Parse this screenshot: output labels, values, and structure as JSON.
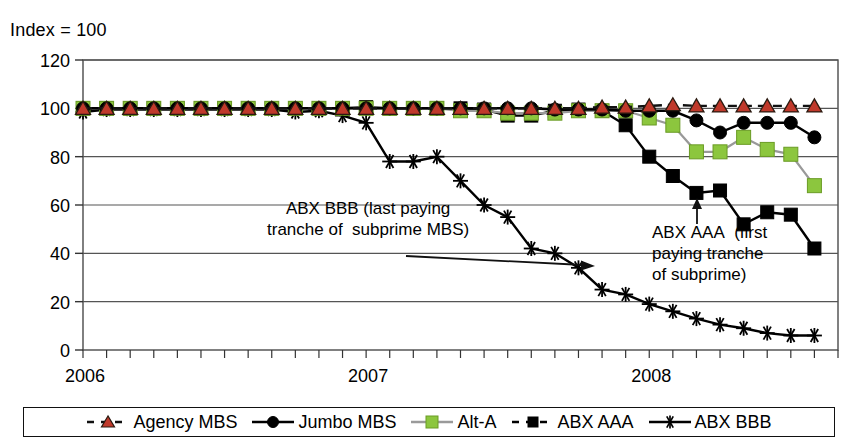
{
  "chart_data": {
    "type": "line",
    "title": "",
    "ylabel": "Index = 100",
    "xlabel": "",
    "ylim": [
      0,
      120
    ],
    "yticks": [
      0,
      20,
      40,
      60,
      80,
      100,
      120
    ],
    "xtick_labels": [
      "2006",
      "2007",
      "2008"
    ],
    "xtick_positions": [
      0,
      12,
      24
    ],
    "x_minor_ticks": 32,
    "grid": "horizontal",
    "legend_position": "bottom",
    "x": [
      0,
      1,
      2,
      3,
      4,
      5,
      6,
      7,
      8,
      9,
      10,
      11,
      12,
      13,
      14,
      15,
      16,
      17,
      18,
      19,
      20,
      21,
      22,
      23,
      24,
      25,
      26,
      27,
      28,
      29,
      30,
      31
    ],
    "series": [
      {
        "name": "Agency MBS",
        "color": "#c0392b",
        "line_color": "#111111",
        "line_style": "dashed",
        "marker": "triangle",
        "values": [
          100,
          100,
          100,
          100,
          100,
          100,
          100,
          100,
          100,
          100,
          100,
          100,
          100,
          100,
          100,
          100,
          100,
          100,
          100,
          100,
          100,
          100,
          100.5,
          100.5,
          101,
          101.5,
          101,
          101,
          101,
          101,
          101,
          101
        ]
      },
      {
        "name": "Jumbo MBS",
        "color": "#000000",
        "line_color": "#000000",
        "line_style": "solid",
        "marker": "circle",
        "values": [
          100,
          100,
          100,
          100,
          100,
          100,
          100,
          100,
          100,
          100,
          100,
          100,
          100,
          100,
          100,
          100,
          100,
          100,
          100,
          100,
          99.5,
          99.5,
          99.5,
          99,
          99,
          99,
          95,
          90,
          94,
          94,
          94,
          88
        ]
      },
      {
        "name": "Alt-A",
        "color": "#8cc63e",
        "line_color": "#999999",
        "line_style": "solid",
        "marker": "square",
        "values": [
          100,
          100,
          100,
          100,
          100,
          100,
          100,
          100,
          100,
          100,
          100,
          100,
          100,
          100,
          100,
          100,
          99,
          99,
          98,
          98,
          98,
          99,
          99,
          99,
          96,
          93,
          82,
          82,
          88,
          83,
          81,
          68
        ]
      },
      {
        "name": "ABX AAA",
        "color": "#000000",
        "line_color": "#000000",
        "line_style": "solid",
        "marker": "filled-square",
        "values": [
          100,
          100,
          100,
          100,
          100,
          100,
          100,
          100,
          100,
          100,
          100,
          100,
          100.5,
          100,
          100,
          100,
          100,
          99.5,
          97,
          97,
          99,
          99.5,
          99,
          93,
          80,
          72,
          65,
          66,
          52,
          57,
          56,
          42
        ]
      },
      {
        "name": "ABX BBB",
        "color": "#000000",
        "line_color": "#000000",
        "line_style": "solid",
        "marker": "asterisk",
        "values": [
          98.5,
          99.5,
          99.5,
          99.5,
          99.5,
          99.5,
          99.5,
          99.5,
          99.5,
          98.5,
          99,
          97,
          94,
          78,
          78,
          80,
          70,
          60,
          55,
          42,
          40,
          34,
          25,
          23,
          19,
          16,
          13,
          10.5,
          9,
          7,
          6,
          6
        ]
      }
    ],
    "annotations": [
      {
        "name": "abx-bbb-annotation",
        "lines": [
          "ABX BBB (last paying",
          "tranche of  subprime MBS)"
        ],
        "arrow": {
          "x1": 406,
          "y1": 256,
          "x2": 595,
          "y2": 266,
          "head": "right"
        }
      },
      {
        "name": "abx-aaa-annotation",
        "lines": [
          "ABX AAA  (first",
          "paying tranche",
          "of subprime)"
        ],
        "arrow": {
          "x1": 697,
          "y1": 224,
          "x2": 697,
          "y2": 198,
          "head": "up"
        }
      }
    ]
  },
  "legend": {
    "items": [
      {
        "label": "Agency MBS",
        "marker": "triangle",
        "color": "#c0392b",
        "line_style": "dashed",
        "line_color": "#111111"
      },
      {
        "label": "Jumbo MBS",
        "marker": "circle",
        "color": "#000000",
        "line_style": "solid",
        "line_color": "#000000"
      },
      {
        "label": "Alt-A",
        "marker": "square",
        "color": "#8cc63e",
        "line_style": "solid",
        "line_color": "#9a9a9a"
      },
      {
        "label": "ABX AAA",
        "marker": "filled-square",
        "color": "#000000",
        "line_style": "dashed",
        "line_color": "#000000"
      },
      {
        "label": "ABX BBB",
        "marker": "asterisk",
        "color": "#000000",
        "line_style": "solid",
        "line_color": "#000000"
      }
    ]
  },
  "axis": {
    "index_label": "Index = 100"
  }
}
